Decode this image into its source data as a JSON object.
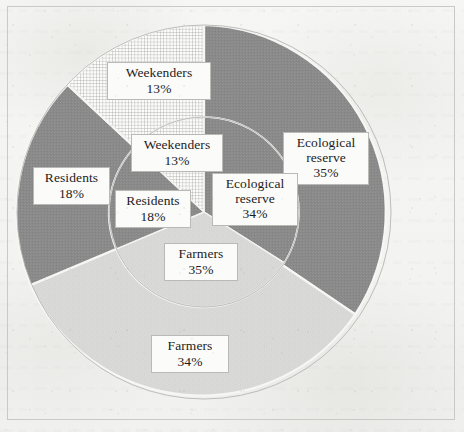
{
  "figure": {
    "background_color": "#f4f4f2",
    "frame_color": "#c9c9c6"
  },
  "chart_data": {
    "type": "pie",
    "title": "",
    "subtitle": "",
    "xlabel": "",
    "ylabel": "",
    "legend_position": "none",
    "grid": false,
    "categories": [
      "Ecological reserve",
      "Farmers",
      "Residents",
      "Weekenders"
    ],
    "series": [
      {
        "name": "Outer ring",
        "ring": "outer",
        "values": [
          35,
          34,
          18,
          13
        ],
        "value_labels": [
          "35%",
          "34%",
          "18%",
          "13%"
        ]
      },
      {
        "name": "Inner pie",
        "ring": "inner",
        "values": [
          34,
          35,
          18,
          13
        ],
        "value_labels": [
          "34%",
          "35%",
          "18%",
          "13%"
        ]
      }
    ],
    "slices": [
      {
        "category": "Ecological reserve",
        "outer_percent": 35,
        "inner_percent": 34,
        "fill": "#8a8a8a",
        "pattern": "solid",
        "outer_start_deg": 0,
        "outer_end_deg": 126,
        "inner_start_deg": 0,
        "inner_end_deg": 122.4
      },
      {
        "category": "Farmers",
        "outer_percent": 34,
        "inner_percent": 35,
        "fill": "#d7d7d7",
        "pattern": "fine-dots",
        "outer_start_deg": 126,
        "outer_end_deg": 248.4,
        "inner_start_deg": 122.4,
        "inner_end_deg": 248.4
      },
      {
        "category": "Residents",
        "outer_percent": 18,
        "inner_percent": 18,
        "fill": "#8a8a8a",
        "pattern": "solid",
        "outer_start_deg": 248.4,
        "outer_end_deg": 313.2,
        "inner_start_deg": 248.4,
        "inner_end_deg": 313.2
      },
      {
        "category": "Weekenders",
        "outer_percent": 13,
        "inner_percent": 13,
        "fill": "#fbfbfa",
        "pattern": "fine-grid",
        "outer_start_deg": 313.2,
        "outer_end_deg": 360,
        "inner_start_deg": 313.2,
        "inner_end_deg": 360
      }
    ],
    "geometry": {
      "center_x": 204,
      "center_y": 212,
      "outer_radius": 187,
      "inner_radius": 95
    }
  },
  "labels": [
    {
      "id": "outer-weekenders",
      "name": "Weekenders",
      "value": "13%",
      "x": 107,
      "y": 62,
      "width": 104
    },
    {
      "id": "outer-ecological-reserve",
      "name": "Ecological reserve",
      "value": "35%",
      "x": 283,
      "y": 132,
      "width": 86
    },
    {
      "id": "outer-residents",
      "name": "Residents",
      "value": "18%",
      "x": 33,
      "y": 167,
      "width": 77
    },
    {
      "id": "outer-farmers",
      "name": "Farmers",
      "value": "34%",
      "x": 151,
      "y": 335,
      "width": 78
    },
    {
      "id": "inner-weekenders",
      "name": "Weekenders",
      "value": "13%",
      "x": 131,
      "y": 134,
      "width": 92
    },
    {
      "id": "inner-ecological-reserve",
      "name": "Ecological reserve",
      "value": "34%",
      "x": 212,
      "y": 173,
      "width": 86
    },
    {
      "id": "inner-residents",
      "name": "Residents",
      "value": "18%",
      "x": 115,
      "y": 190,
      "width": 76
    },
    {
      "id": "inner-farmers",
      "name": "Farmers",
      "value": "35%",
      "x": 164,
      "y": 243,
      "width": 74
    }
  ]
}
